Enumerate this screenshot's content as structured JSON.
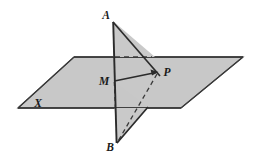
{
  "figure": {
    "background_color": "#ffffff",
    "plane_fill_color": "#c6c6c6",
    "triangle_fill_color": "#c9c9c9",
    "stroke_color": "#2b2b2b",
    "label_color": "#1a1a1a",
    "labels": {
      "apex_top": "A",
      "apex_bottom": "B",
      "intersection": "M",
      "point_in_plane": "P",
      "plane": "X"
    },
    "points": {
      "A": {
        "x": 113,
        "y": 21
      },
      "B": {
        "x": 117,
        "y": 144
      },
      "M": {
        "x": 114,
        "y": 81
      },
      "P": {
        "x": 157,
        "y": 72
      },
      "plane_left": {
        "x": 18,
        "y": 108
      },
      "plane_top": {
        "x": 74,
        "y": 57
      },
      "plane_right": {
        "x": 243,
        "y": 57
      },
      "plane_bottom": {
        "x": 181,
        "y": 108
      },
      "upper_tri_foot": {
        "x": 162,
        "y": 77
      },
      "lower_tri_foot": {
        "x": 148,
        "y": 107
      }
    },
    "label_positions": {
      "A": {
        "x": 106,
        "y": 16
      },
      "B": {
        "x": 110,
        "y": 147
      },
      "M": {
        "x": 104,
        "y": 82
      },
      "P": {
        "x": 166,
        "y": 73
      },
      "X": {
        "x": 38,
        "y": 104
      }
    },
    "segments": {
      "line_AB": "vertical line from A through M to B",
      "segment_MP": "solid segment from M to P with arrowhead at P",
      "dashed_horizontal": "dashed line along plane top edge from line AB to P region",
      "dashed_vertical": "dashed segment from M down to bottom edge of plane",
      "dashed_diagonal": "dashed segment from P down-left toward B"
    }
  }
}
